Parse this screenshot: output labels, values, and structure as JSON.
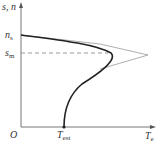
{
  "diagram": {
    "type": "torque-speed characteristic",
    "y_axis_label": "s, n",
    "x_axis_label": {
      "main": "T",
      "sub": "e"
    },
    "origin_label": "O",
    "y_ticks": [
      {
        "main": "n",
        "sub": "s"
      },
      {
        "main": "s",
        "sub": "m"
      }
    ],
    "x_ticks": [
      {
        "main": "T",
        "sub": "est"
      }
    ],
    "curves": [
      {
        "name": "natural characteristic",
        "style": "thick solid",
        "color": "#222222"
      },
      {
        "name": "simplified characteristic",
        "style": "thin solid",
        "color": "#888888"
      },
      {
        "name": "s_m reference",
        "style": "dashed",
        "color": "#999999"
      }
    ]
  }
}
